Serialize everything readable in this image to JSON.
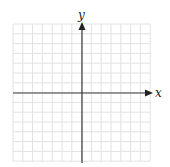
{
  "diagram": {
    "type": "coordinate-plane",
    "x_axis_label": "x",
    "y_axis_label": "y",
    "grid": {
      "cells_per_side": 7,
      "cell_size_px": 9.8,
      "left_px": 13,
      "top_px": 24,
      "origin_px": [
        82,
        93
      ],
      "line_color": "#e2e2e2",
      "axis_color": "#3a3a3a"
    }
  }
}
